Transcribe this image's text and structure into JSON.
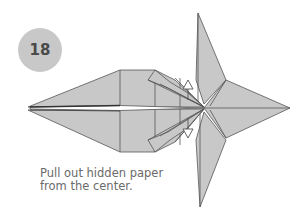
{
  "step": {
    "number": "18"
  },
  "instruction": {
    "line1": "Pull out hidden paper",
    "line2": "from the center."
  },
  "arrows": [
    {
      "name": "pull-up-arrow",
      "direction": "up"
    },
    {
      "name": "pull-down-arrow",
      "direction": "down"
    }
  ],
  "colors": {
    "paper": "#c8c8c8",
    "line": "#555555",
    "badge": "#c8c8c8",
    "badge_text": "#4a4a4a",
    "caption_text": "#6a6a6a",
    "background": "#ffffff"
  }
}
